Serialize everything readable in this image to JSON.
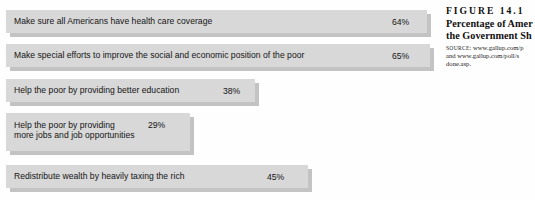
{
  "chart_data": {
    "type": "bar",
    "orientation": "horizontal",
    "title": "Percentage of Amer",
    "xlabel": "",
    "ylabel": "",
    "grid": false,
    "legend": null,
    "xlim": [
      0,
      70
    ],
    "categories": [
      "Make sure all Americans have health care coverage",
      "Make special efforts to improve the social and economic position of the poor",
      "Help the poor by providing better education",
      "Help the poor by providing\nmore jobs and job opportunities",
      "Redistribute wealth by heavily taxing the rich"
    ],
    "values": [
      64,
      65,
      38,
      29,
      45
    ],
    "value_labels": [
      "64%",
      "65%",
      "38%",
      "29%",
      "45%"
    ]
  },
  "chart": {
    "bars": [
      {
        "label": "Make sure all Americans have health care coverage",
        "value_label": "64%"
      },
      {
        "label": "Make special efforts to improve the social and economic position of the poor",
        "value_label": "65%"
      },
      {
        "label": "Help the poor by providing better education",
        "value_label": "38%"
      },
      {
        "label": "Help the poor by providing\nmore jobs and job opportunities",
        "value_label": "29%"
      },
      {
        "label": "Redistribute wealth by heavily taxing the rich",
        "value_label": "45%"
      }
    ]
  },
  "caption": {
    "figure_number": "FIGURE  14.1",
    "title": "Percentage of Amer\nthe Government Sh",
    "source_label": "SOURCE:",
    "source_text": " www.gallup.com/p\nand www.gallup.com/poll/s\ndone.asp."
  },
  "colors": {
    "bar_fill": "#d8d8d8",
    "bar_shadow": "#c3c3c3",
    "text": "#141414",
    "background": "#ffffff"
  }
}
